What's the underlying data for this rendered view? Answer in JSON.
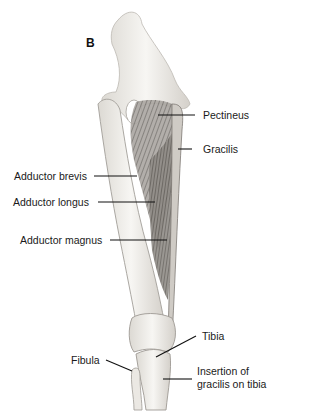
{
  "figure": {
    "panel_letter": "B",
    "labels": {
      "pectineus": "Pectineus",
      "gracilis": "Gracilis",
      "adductor_brevis": "Adductor brevis",
      "adductor_longus": "Adductor longus",
      "adductor_magnus": "Adductor magnus",
      "tibia": "Tibia",
      "fibula": "Fibula",
      "insertion_line1": "Insertion of",
      "insertion_line2": "gracilis on tibia"
    },
    "colors": {
      "bone": "#f2f0ec",
      "bone_outline": "#9a9690",
      "muscle": "#6e6a66",
      "leader": "#111111"
    }
  }
}
